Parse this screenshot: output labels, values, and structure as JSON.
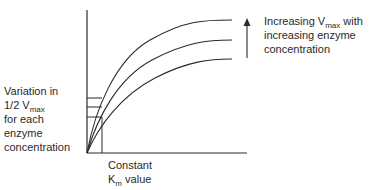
{
  "diagram": {
    "type": "Michaelis-Menten curves",
    "curves": 3,
    "right_annotation": {
      "line1_prefix": "Increasing V",
      "line1_sub": "max",
      "line1_suffix": " with",
      "line2": "increasing enzyme",
      "line3": "concentration"
    },
    "left_annotation": {
      "line1": "Variation in",
      "line2_prefix": "1/2 V",
      "line2_sub": "max",
      "line3": "for each",
      "line4": "enzyme",
      "line5": "concentration"
    },
    "bottom_annotation": {
      "line1": "Constant",
      "line2_prefix": "K",
      "line2_sub": "m",
      "line2_suffix": " value"
    },
    "stroke_color": "#2a2a2a"
  }
}
